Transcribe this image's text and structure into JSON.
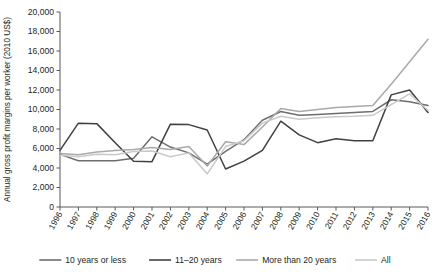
{
  "chart_data": {
    "type": "line",
    "title": "",
    "xlabel": "",
    "ylabel": "Annual gross profit margins per worker (2010 US$)",
    "ylim": [
      0,
      20000
    ],
    "ytick_labels": [
      "0",
      "2,000",
      "4,000",
      "6,000",
      "8,000",
      "10,000",
      "12,000",
      "14,000",
      "16,000",
      "18,000",
      "20,000"
    ],
    "ytick_values": [
      0,
      2000,
      4000,
      6000,
      8000,
      10000,
      12000,
      14000,
      16000,
      18000,
      20000
    ],
    "grid": false,
    "legend_position": "bottom",
    "categories": [
      "1996",
      "1997",
      "1998",
      "1999",
      "2000",
      "2001",
      "2002",
      "2003",
      "2004",
      "2005",
      "2006",
      "2007",
      "2008",
      "2009",
      "2010",
      "2011",
      "2012",
      "2013",
      "2014",
      "2015",
      "2016"
    ],
    "series": [
      {
        "name": "10 years or less",
        "color": "#6d6e71",
        "values": [
          5400,
          4750,
          4750,
          4750,
          5000,
          7200,
          6150,
          5550,
          4400,
          5700,
          6900,
          8900,
          9800,
          9400,
          9500,
          9600,
          9700,
          9800,
          11000,
          10800,
          10400
        ]
      },
      {
        "name": "11–20 years",
        "color": "#404041",
        "values": [
          5800,
          8600,
          8550,
          6600,
          4700,
          4650,
          8500,
          8450,
          7900,
          3900,
          4700,
          5800,
          8800,
          7400,
          6600,
          7000,
          6800,
          6800,
          11500,
          12000,
          9700
        ]
      },
      {
        "name": "More than 20 years",
        "color": "#a7a9ac",
        "values": [
          5500,
          5350,
          5650,
          5800,
          5900,
          6100,
          5900,
          6200,
          4200,
          6700,
          6400,
          8200,
          10100,
          9800,
          10000,
          10200,
          10300,
          10400,
          12600,
          14900,
          17200
        ]
      },
      {
        "name": "All",
        "color": "#c8c9cb",
        "values": [
          5300,
          5150,
          5400,
          5350,
          5700,
          5750,
          5150,
          5550,
          3400,
          6200,
          6800,
          8600,
          9300,
          9000,
          9150,
          9250,
          9300,
          9400,
          10500,
          11600,
          9900
        ]
      }
    ]
  },
  "legend": {
    "items": [
      {
        "label": "10 years or less"
      },
      {
        "label": "11–20 years"
      },
      {
        "label": "More than 20 years"
      },
      {
        "label": "All"
      }
    ]
  }
}
